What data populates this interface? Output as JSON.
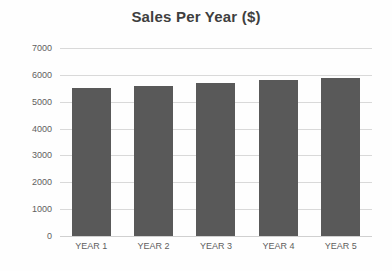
{
  "chart_data": {
    "type": "bar",
    "title": "Sales Per Year ($)",
    "xlabel": "",
    "ylabel": "",
    "categories": [
      "YEAR 1",
      "YEAR 2",
      "YEAR 3",
      "YEAR 4",
      "YEAR 5"
    ],
    "values": [
      5500,
      5600,
      5700,
      5800,
      5900
    ],
    "ylim": [
      0,
      7000
    ],
    "ytick_labels": [
      "7000",
      "6000",
      "5000",
      "4000",
      "3000",
      "2000",
      "1000",
      "0"
    ],
    "ytick_values": [
      7000,
      6000,
      5000,
      4000,
      3000,
      2000,
      1000,
      0
    ],
    "ystep": 1000,
    "grid": "horizontal",
    "legend": "none",
    "series": [
      {
        "name": "Sales",
        "values": [
          5500,
          5600,
          5700,
          5800,
          5900
        ]
      }
    ],
    "colors": {
      "bar": "#595959",
      "gridline": "#d9d9d9",
      "title_text": "#3f3f3f",
      "tick_text": "#5f5f5f",
      "background": "#fefefe"
    }
  }
}
